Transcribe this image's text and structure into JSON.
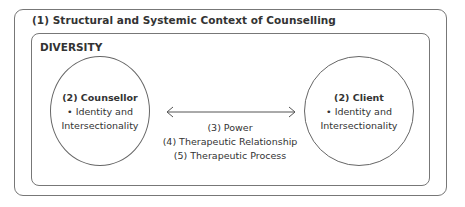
{
  "outer_context": {
    "title": "(1) Structural and Systemic Context of Counselling"
  },
  "inner_context": {
    "title": "DIVERSITY"
  },
  "counsellor": {
    "title": "(2) Counsellor",
    "lines": [
      "• Identity and",
      "Intersectionality"
    ]
  },
  "client": {
    "title": "(2) Client",
    "lines": [
      "• Identity and",
      "Intersectionality"
    ]
  },
  "connector": {
    "icon": "double-headed-arrow-icon",
    "labels": [
      "(3) Power",
      "(4) Therapeutic Relationship",
      "(5) Therapeutic Process"
    ]
  },
  "colors": {
    "stroke": "#777777",
    "text": "#333333",
    "background": "#ffffff"
  }
}
